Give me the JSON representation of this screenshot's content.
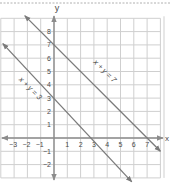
{
  "page": {
    "top_divider": "dashed"
  },
  "chart_data": {
    "type": "line",
    "title": "",
    "xlabel": "x",
    "ylabel": "y",
    "xlim": [
      -4,
      8
    ],
    "ylim": [
      -3,
      9
    ],
    "grid": true,
    "x_ticks": [
      -3,
      -2,
      -1,
      1,
      2,
      3,
      4,
      5,
      6,
      7
    ],
    "y_ticks": [
      -2,
      -1,
      1,
      2,
      3,
      4,
      5,
      6,
      7,
      8
    ],
    "x_tick_labels": [
      "−3",
      "−2",
      "−1",
      "1",
      "2",
      "3",
      "4",
      "5",
      "6",
      "7"
    ],
    "y_tick_labels": [
      "−2",
      "−1",
      "1",
      "2",
      "3",
      "4",
      "5",
      "6",
      "7",
      "8"
    ],
    "series": [
      {
        "name": "x + y = 7",
        "label": "x + y = 7",
        "equation": "x + y = 7",
        "x_intercept": 7,
        "y_intercept": 7,
        "points": [
          [
            -2.2,
            9.2
          ],
          [
            0,
            7
          ],
          [
            7,
            0
          ],
          [
            8.0,
            -1.0
          ]
        ],
        "arrows": "both",
        "color": "#7a7a7a"
      },
      {
        "name": "x + y = 3",
        "label": "x + y = 3",
        "equation": "x + y = 3",
        "x_intercept": 3,
        "y_intercept": 3,
        "points": [
          [
            -3.85,
            7.1
          ],
          [
            0,
            3
          ],
          [
            3,
            0
          ],
          [
            5.85,
            -3.3
          ]
        ],
        "arrows": "both",
        "color": "#7a7a7a"
      }
    ],
    "axis_color": "#8a8a8a",
    "grid_color": "#c8c8c8"
  },
  "colors": {
    "background": "#ffffff",
    "grid": "#cfcfcf",
    "axis": "#8c8c8c",
    "line": "#7a7a7a",
    "text": "#4a4a4a",
    "divider": "#b0b0b0"
  }
}
